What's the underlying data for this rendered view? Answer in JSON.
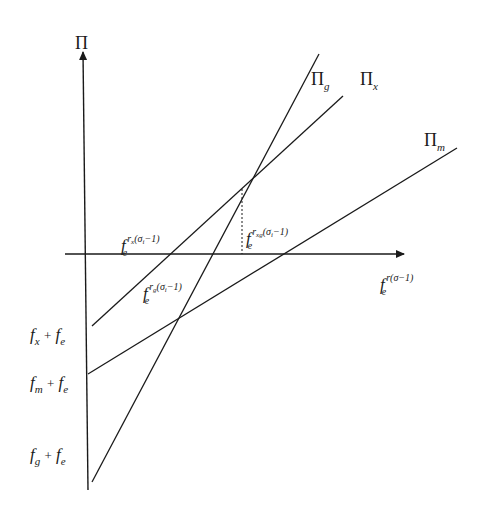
{
  "diagram": {
    "axes": {
      "y_label": "Π",
      "x_label": {
        "base": "f",
        "sub": "e",
        "sup": "r(σ−1)"
      }
    },
    "lines": [
      {
        "id": "pi_g",
        "label": "Π",
        "label_sub": "g",
        "intercept_label": {
          "f1": "f",
          "s1": "g",
          "plus": "+",
          "f2": "f",
          "s2": "e"
        }
      },
      {
        "id": "pi_x",
        "label": "Π",
        "label_sub": "x",
        "intercept_label": {
          "f1": "f",
          "s1": "x",
          "plus": "+",
          "f2": "f",
          "s2": "e"
        }
      },
      {
        "id": "pi_m",
        "label": "Π",
        "label_sub": "m",
        "intercept_label": {
          "f1": "f",
          "s1": "m",
          "plus": "+",
          "f2": "f",
          "s2": "e"
        }
      }
    ],
    "annotations": {
      "rx": {
        "base": "f",
        "sub": "e",
        "sup_r": "r",
        "sup_rs": "x",
        "sup_rest": "(σ",
        "sup_i": "i",
        "sup_end": "−1)"
      },
      "rg": {
        "base": "f",
        "sub": "e",
        "sup_r": "r",
        "sup_rs": "g",
        "sup_rest": "(σ",
        "sup_i": "i",
        "sup_end": "−1)"
      },
      "rxg": {
        "base": "f",
        "sub": "e",
        "sup_r": "r",
        "sup_rs": "xg",
        "sup_rest": "(σ",
        "sup_i": "i",
        "sup_end": "−1)"
      }
    },
    "colors": {
      "line": "#1a1a1a",
      "background": "#ffffff"
    }
  }
}
